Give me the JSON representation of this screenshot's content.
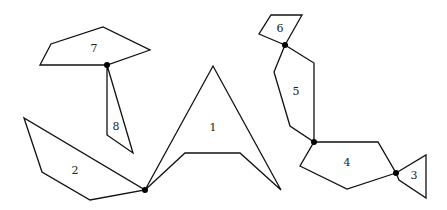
{
  "diagram": {
    "title": "",
    "pieces": [
      {
        "id": "1",
        "label": "1",
        "points": "145,190 213,66 281,190 240,153 185,153",
        "label_pos": [
          213,
          127
        ]
      },
      {
        "id": "2",
        "label": "2",
        "points": "24,118 42,172 90,200 145,190",
        "label_pos": [
          75,
          170
        ]
      },
      {
        "id": "3",
        "label": "3",
        "points": "396,173 426,155 426,198 399,180",
        "label_pos": [
          414,
          175
        ]
      },
      {
        "id": "4",
        "label": "4",
        "points": "314,142 378,142 396,173 347,189 300,166",
        "label_pos": [
          347,
          162
        ]
      },
      {
        "id": "5",
        "label": "5",
        "points": "285,45 314,63 314,142 290,126 274,72",
        "label_pos": [
          296,
          91
        ]
      },
      {
        "id": "6",
        "label": "6",
        "points": "271,15 302,15 285,45 259,34",
        "label_pos": [
          280,
          28
        ]
      },
      {
        "id": "7",
        "label": "7",
        "points": "40,65 51,44 103,27 150,50 107,65",
        "label_pos": [
          94,
          48
        ]
      },
      {
        "id": "8",
        "label": "8",
        "points": "107,65 107,135 133,153",
        "label_pos": [
          116,
          126
        ]
      }
    ],
    "joints": [
      {
        "id": "j78",
        "x": 107,
        "y": 65
      },
      {
        "id": "j12",
        "x": 145,
        "y": 190
      },
      {
        "id": "j56",
        "x": 285,
        "y": 45
      },
      {
        "id": "j45",
        "x": 314,
        "y": 142
      },
      {
        "id": "j34",
        "x": 396,
        "y": 173
      }
    ],
    "colors": {
      "stroke": "#111111",
      "joint": "#000000",
      "background": "#ffffff"
    }
  }
}
